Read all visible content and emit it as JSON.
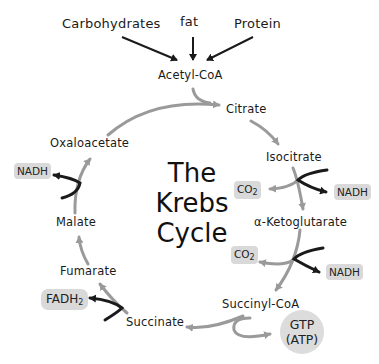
{
  "diagram": {
    "title_lines": [
      "The",
      "Krebs",
      "Cycle"
    ],
    "inputs": [
      "Carbohydrates",
      "fat",
      "Protein"
    ],
    "entry": "Acetyl-CoA",
    "intermediates": [
      "Citrate",
      "Isocitrate",
      "α-Ketoglutarate",
      "Succinyl-CoA",
      "Succinate",
      "Fumarate",
      "Malate",
      "Oxaloacetate"
    ],
    "byproducts": {
      "isocitrate_co2": "CO",
      "isocitrate_co2_sub": "2",
      "isocitrate_nadh": "NADH",
      "ketoglutarate_co2": "CO",
      "ketoglutarate_co2_sub": "2",
      "ketoglutarate_nadh": "NADH",
      "succinyl_gtp": "GTP",
      "succinyl_atp": "(ATP)",
      "succinate_fadh2": "FADH",
      "succinate_fadh2_sub": "2",
      "malate_nadh": "NADH"
    },
    "colors": {
      "cycle_arrow": "#9a9a9a",
      "input_arrow": "#1a1a1a",
      "chip_bg": "#d9d9d9",
      "text": "#1a1a1a"
    }
  }
}
